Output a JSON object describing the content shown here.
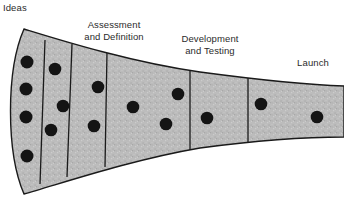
{
  "diagram": {
    "type": "funnel-stage-diagram",
    "colors": {
      "funnel_fill": "#b9b9b9",
      "funnel_stroke": "#1a1a1a",
      "dot_fill": "#141414",
      "text": "#2b2b2b",
      "background": "#ffffff"
    },
    "labels": [
      {
        "id": "ideas",
        "text": "Ideas"
      },
      {
        "id": "assessment",
        "text": "Assessment\nand Definition"
      },
      {
        "id": "development",
        "text": "Development\nand Testing"
      },
      {
        "id": "launch",
        "text": "Launch"
      }
    ],
    "stages": [
      {
        "index": 1,
        "name": "Ideas",
        "dot_count": 4
      },
      {
        "index": 2,
        "name": "Screening",
        "dot_count": 3
      },
      {
        "index": 3,
        "name": "Assessment and Definition",
        "dot_count": 2
      },
      {
        "index": 4,
        "name": "Development",
        "dot_count": 3
      },
      {
        "index": 5,
        "name": "Testing",
        "dot_count": 1
      },
      {
        "index": 6,
        "name": "Launch",
        "dot_count": 2
      }
    ],
    "dots": [
      {
        "cx": 27,
        "cy": 62,
        "r": 6.5
      },
      {
        "cx": 26,
        "cy": 89,
        "r": 6.5
      },
      {
        "cx": 26,
        "cy": 117,
        "r": 6.5
      },
      {
        "cx": 27,
        "cy": 156,
        "r": 6.5
      },
      {
        "cx": 55,
        "cy": 69,
        "r": 6.3
      },
      {
        "cx": 63,
        "cy": 106,
        "r": 6.3
      },
      {
        "cx": 51,
        "cy": 130,
        "r": 6.3
      },
      {
        "cx": 98,
        "cy": 87,
        "r": 6.3
      },
      {
        "cx": 94,
        "cy": 126,
        "r": 6.3
      },
      {
        "cx": 133,
        "cy": 107,
        "r": 6.3
      },
      {
        "cx": 166,
        "cy": 124,
        "r": 6.3
      },
      {
        "cx": 178,
        "cy": 94,
        "r": 6.3
      },
      {
        "cx": 207,
        "cy": 118,
        "r": 6.3
      },
      {
        "cx": 261,
        "cy": 104,
        "r": 6.3
      },
      {
        "cx": 317,
        "cy": 117,
        "r": 6.3
      }
    ],
    "dividers": [
      {
        "index": 1,
        "x_top": 45,
        "y_top": 45,
        "x_bottom": 40,
        "y_bottom": 178
      },
      {
        "index": 2,
        "x_top": 71,
        "y_top": 49,
        "x_bottom": 68,
        "y_bottom": 172
      },
      {
        "index": 3,
        "x_top": 106,
        "y_top": 55,
        "x_bottom": 106,
        "y_bottom": 163
      },
      {
        "index": 4,
        "x_top": 190,
        "y_top": 70,
        "x_bottom": 190,
        "y_bottom": 146
      },
      {
        "index": 5,
        "x_top": 248,
        "y_top": 80,
        "x_bottom": 248,
        "y_bottom": 139
      }
    ],
    "outline": {
      "top_edge": "M 24 29 C 60 40 130 62 200 72 C 260 80 310 85 340 86",
      "bottom_edge": "M 24 194 C 60 184 130 160 200 148 C 260 140 310 137 340 137",
      "left_arc": "M 24 29 C 6 70 6 152 24 194"
    }
  }
}
